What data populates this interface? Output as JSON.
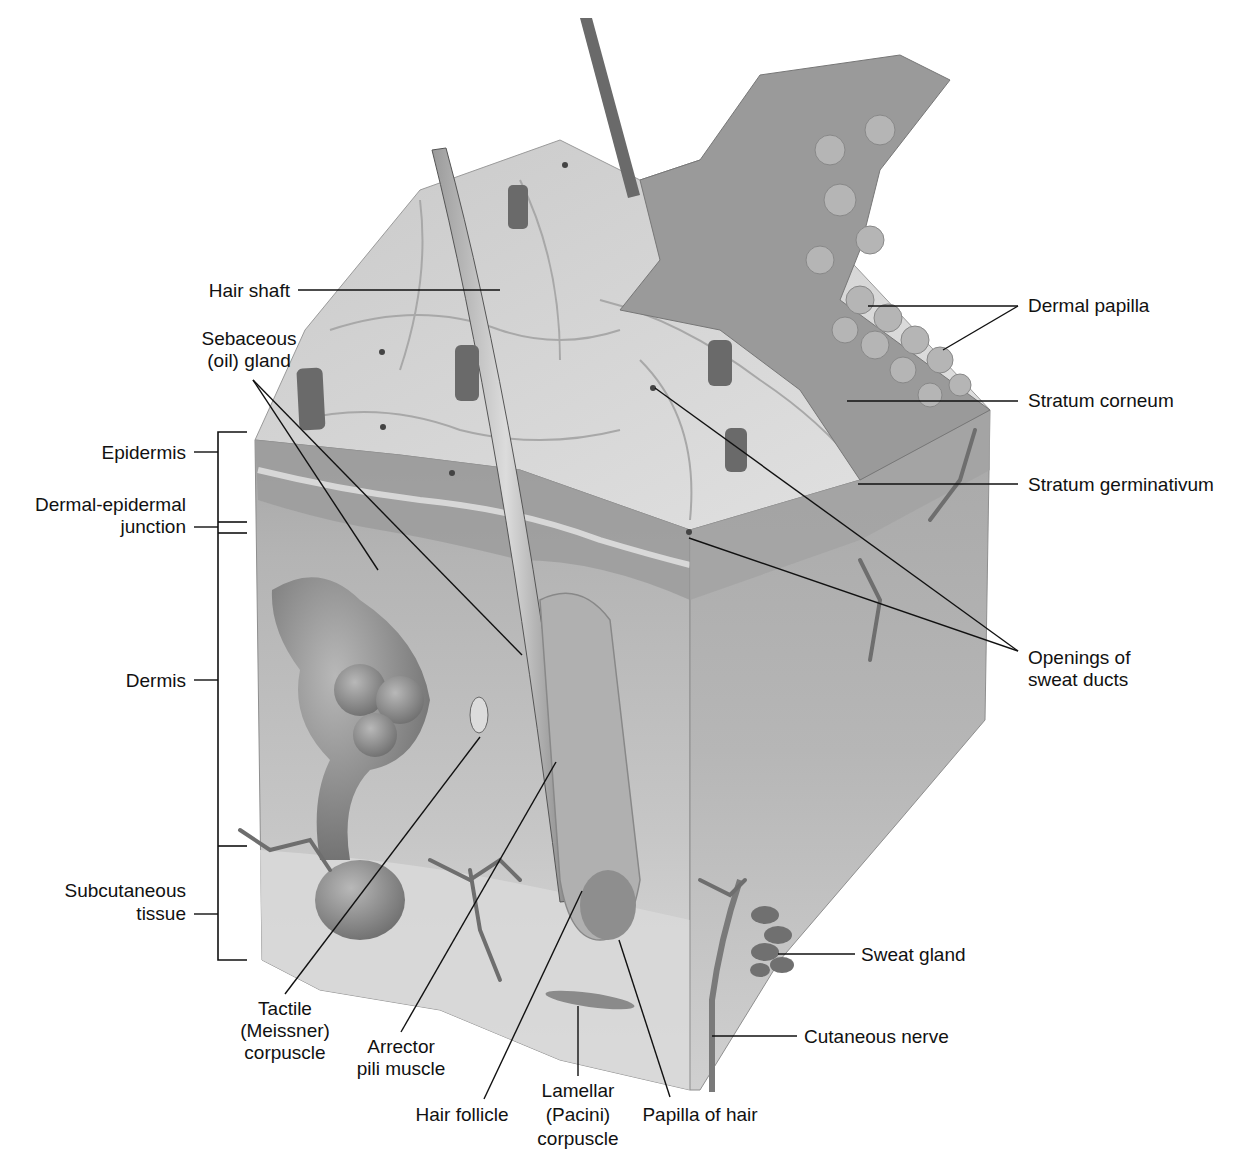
{
  "figure": {
    "colors": {
      "background": "#ffffff",
      "label_text": "#111111",
      "leader_lines": "#111111",
      "surface": "#d4d4d4",
      "epidermis": "#a8a8a8",
      "dermis": "#c4c4c4",
      "subcutaneous": "#dcdcdc",
      "right_face": "#b8b8b8",
      "gland": "#8a8a8a"
    }
  },
  "labels_left": {
    "hair_shaft": "Hair shaft",
    "sebaceous_line1": "Sebaceous",
    "sebaceous_line2": "(oil) gland",
    "epidermis": "Epidermis",
    "dej_line1": "Dermal-epidermal",
    "dej_line2": "junction",
    "dermis": "Dermis",
    "subcutaneous_line1": "Subcutaneous",
    "subcutaneous_line2": "tissue"
  },
  "labels_right": {
    "dermal_papilla": "Dermal papilla",
    "stratum_corneum": "Stratum corneum",
    "stratum_germinativum": "Stratum germinativum",
    "sweat_ducts_line1": "Openings of",
    "sweat_ducts_line2": "sweat ducts",
    "sweat_gland": "Sweat gland",
    "cutaneous_nerve": "Cutaneous nerve"
  },
  "labels_bottom": {
    "tactile_line1": "Tactile",
    "tactile_line2": "(Meissner)",
    "tactile_line3": "corpuscle",
    "arrector_line1": "Arrector",
    "arrector_line2": "pili muscle",
    "hair_follicle": "Hair follicle",
    "lamellar_line1": "Lamellar",
    "lamellar_line2": "(Pacini)",
    "lamellar_line3": "corpuscle",
    "papilla_of_hair": "Papilla of hair"
  }
}
